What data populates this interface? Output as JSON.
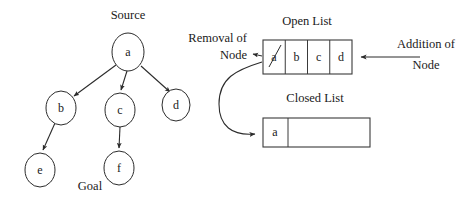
{
  "figure": {
    "background_color": "#ffffff",
    "stroke_color": "#2b2b2b"
  },
  "tree": {
    "source_caption": "Source",
    "goal_caption": "Goal",
    "nodes": [
      {
        "id": "a",
        "label": "a",
        "cx": 128,
        "cy": 52,
        "rx": 16,
        "ry": 19
      },
      {
        "id": "b",
        "label": "b",
        "cx": 61,
        "cy": 108,
        "rx": 15,
        "ry": 17
      },
      {
        "id": "c",
        "label": "c",
        "cx": 120,
        "cy": 110,
        "rx": 15,
        "ry": 17
      },
      {
        "id": "d",
        "label": "d",
        "cx": 176,
        "cy": 105,
        "rx": 14,
        "ry": 16
      },
      {
        "id": "e",
        "label": "e",
        "cx": 40,
        "cy": 170,
        "rx": 15,
        "ry": 17
      },
      {
        "id": "f",
        "label": "f",
        "cx": 119,
        "cy": 168,
        "rx": 15,
        "ry": 17
      }
    ],
    "edges": [
      {
        "from": "a",
        "to": "b"
      },
      {
        "from": "a",
        "to": "c"
      },
      {
        "from": "a",
        "to": "d"
      },
      {
        "from": "b",
        "to": "e"
      },
      {
        "from": "c",
        "to": "f"
      }
    ]
  },
  "open_list": {
    "title": "Open List",
    "cells": [
      {
        "label": "a",
        "struck_out": true
      },
      {
        "label": "b",
        "struck_out": false
      },
      {
        "label": "c",
        "struck_out": false
      },
      {
        "label": "d",
        "struck_out": false
      }
    ]
  },
  "closed_list": {
    "title": "Closed List",
    "cells": [
      {
        "label": "a",
        "struck_out": false
      },
      {
        "label": "",
        "struck_out": false
      }
    ]
  },
  "annotations": {
    "removal": {
      "line1": "Removal of",
      "line2": "Node"
    },
    "addition": {
      "line1": "Addition of",
      "line2": "Node"
    }
  }
}
